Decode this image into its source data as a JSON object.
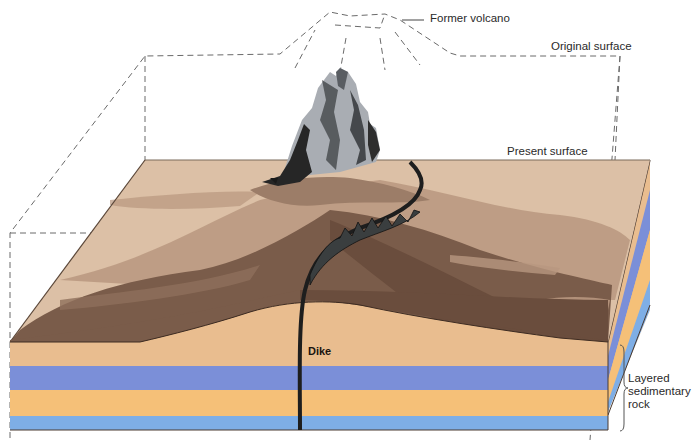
{
  "labels": {
    "former_volcano": "Former volcano",
    "original_surface": "Original surface",
    "present_surface": "Present surface",
    "dike": "Dike",
    "layered_rock_line1": "Layered",
    "layered_rock_line2": "sedimentary",
    "layered_rock_line3": "rock"
  },
  "colors": {
    "surface_light": "#dcc0a6",
    "surface_mid": "#b8977f",
    "surface_dark": "#7a5c4a",
    "surface_darkest": "#6a4d3d",
    "layer_tan": "#e9bd8f",
    "layer_blue": "#7b8fd8",
    "layer_orange": "#f5c078",
    "layer_lightblue": "#7eaee6",
    "rock_gray": "#a9adb3",
    "rock_black": "#2a2a2a",
    "dashed_line": "#666666"
  }
}
